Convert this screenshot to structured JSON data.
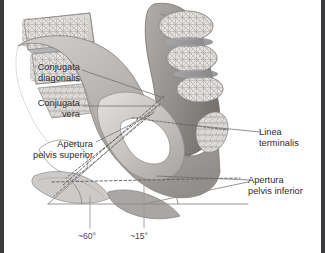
{
  "figure": {
    "frame_color": "#3a3a3c",
    "background_color": "#ffffff",
    "width": 325,
    "height": 253
  },
  "labels": [
    {
      "name": "conjugata-diagonalis",
      "line1": "Conjugata",
      "line2": "diagonalis",
      "align": "right",
      "x": 8,
      "y": 62,
      "width": 72
    },
    {
      "name": "conjugata-vera",
      "line1": "Conjugata",
      "line2": "vera",
      "align": "right",
      "x": 8,
      "y": 98,
      "width": 72
    },
    {
      "name": "apertura-pelvis-superior",
      "line1": "Apertura",
      "line2": "pelvis superior",
      "align": "right",
      "x": 5,
      "y": 139,
      "width": 88
    },
    {
      "name": "linea-terminalis",
      "line1": "Linea",
      "line2": "terminalis",
      "align": "left",
      "x": 259,
      "y": 127,
      "width": 62
    },
    {
      "name": "apertura-pelvis-inferior",
      "line1": "Apertura",
      "line2": "pelvis inferior",
      "align": "left",
      "x": 248,
      "y": 175,
      "width": 76
    }
  ],
  "angle_labels": [
    {
      "name": "pelvic-inlet-angle",
      "value": "~60°",
      "x": 78,
      "y": 231
    },
    {
      "name": "pelvic-outlet-angle",
      "value": "~15°",
      "x": 130,
      "y": 231
    }
  ],
  "anatomy": {
    "regions": [
      "lumbar vertebrae",
      "sacrum",
      "coccyx",
      "ilium",
      "ischium",
      "pubis",
      "obturator foramen",
      "pubic symphysis",
      "intervertebral discs"
    ],
    "bone_light": "#d8d6d4",
    "bone_mid": "#b9b6b3",
    "bone_dark": "#8e8b88",
    "cartilage": "#9a9a9e",
    "trabecular": "#c9c6c3"
  },
  "measurement_lines": {
    "dashed_color": "#5c5c5e",
    "leader_color": "#6e6e70",
    "axis_color": "#8a8a8c"
  }
}
